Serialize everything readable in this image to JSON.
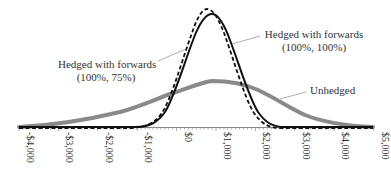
{
  "chart_data": {
    "type": "line",
    "title": "",
    "xlabel": "",
    "ylabel": "",
    "xlim": [
      -4000,
      5000
    ],
    "x_ticks": [
      "-$4,000",
      "-$3,000",
      "-$2,000",
      "-$1,000",
      "$0",
      "$1,000",
      "$2,000",
      "$3,000",
      "$4,000",
      "$5,000"
    ],
    "grid": false,
    "legend": "inline annotations",
    "series": [
      {
        "name": "Unhedged",
        "style": "thick gray solid",
        "color": "#808080",
        "x": [
          -4000,
          -3000,
          -2000,
          -1000,
          0,
          500,
          850,
          1300,
          2000,
          2500,
          3000,
          4000,
          5000
        ],
        "y": [
          0.0,
          0.02,
          0.07,
          0.2,
          0.32,
          0.37,
          0.39,
          0.37,
          0.27,
          0.2,
          0.13,
          0.03,
          0.0
        ]
      },
      {
        "name": "Hedged with forwards (100%, 100%)",
        "style": "black solid",
        "color": "#111111",
        "x": [
          -4000,
          -1000,
          -500,
          0,
          500,
          900,
          1300,
          1700,
          2000,
          2400,
          5000
        ],
        "y": [
          0.0,
          0.0,
          0.05,
          0.28,
          0.75,
          0.93,
          0.75,
          0.28,
          0.06,
          0.0,
          0.0
        ]
      },
      {
        "name": "Hedged with forwards (100%, 75%)",
        "style": "black dashed",
        "color": "#111111",
        "x": [
          -4000,
          -1200,
          -600,
          0,
          400,
          800,
          1200,
          1600,
          2000,
          2400,
          5000
        ],
        "y": [
          0.0,
          0.0,
          0.06,
          0.3,
          0.78,
          0.98,
          0.78,
          0.3,
          0.05,
          0.0,
          0.0
        ]
      }
    ],
    "annotations": [
      {
        "text": "Hedged with forwards",
        "text2": "(100%, 75%)",
        "points_to": "dashed curve"
      },
      {
        "text": "Hedged with forwards",
        "text2": "(100%, 100%)",
        "points_to": "solid curve"
      },
      {
        "text": "Unhedged",
        "points_to": "gray curve"
      }
    ]
  },
  "labels": {
    "left_line1": "Hedged with forwards",
    "left_line2": "(100%, 75%)",
    "right_line1": "Hedged with forwards",
    "right_line2": "(100%, 100%)",
    "unhedged": "Unhedged"
  },
  "ticks": [
    "-$4,000",
    "-$3,000",
    "-$2,000",
    "-$1,000",
    "$0",
    "$1,000",
    "$2,000",
    "$3,000",
    "$4,000",
    "$5,000"
  ]
}
